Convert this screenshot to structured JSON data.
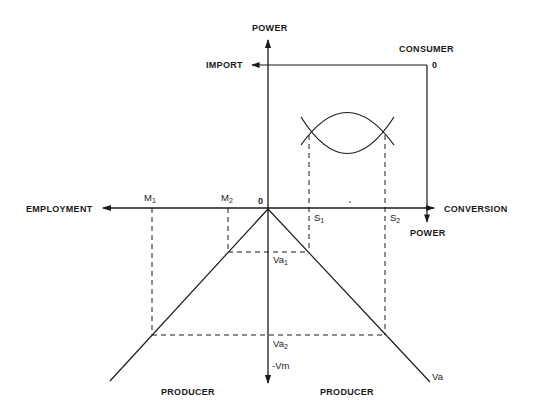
{
  "diagram": {
    "axis_labels": {
      "power_top": "POWER",
      "import": "IMPORT",
      "consumer": "CONSUMER",
      "consumer_zero": "0",
      "employment": "EMPLOYMENT",
      "conversion": "CONVERSION",
      "power_right": "POWER",
      "origin": "0",
      "producer_left": "PRODUCER",
      "producer_right": "PRODUCER"
    },
    "points": {
      "m1": {
        "base": "M",
        "sub": "1"
      },
      "m2": {
        "base": "M",
        "sub": "2"
      },
      "s1": {
        "base": "S",
        "sub": "1"
      },
      "s2": {
        "base": "S",
        "sub": "2"
      },
      "va1": {
        "base": "Va",
        "sub": "1"
      },
      "va2": {
        "base": "Va",
        "sub": "2"
      },
      "vm": "-Vm",
      "va": "Va"
    },
    "colors": {
      "line": "#1a1a1a",
      "background": "#ffffff"
    }
  }
}
